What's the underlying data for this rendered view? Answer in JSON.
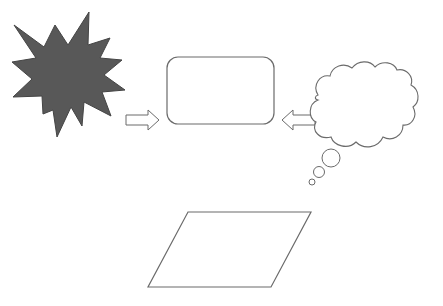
{
  "diagram": {
    "colors": {
      "background": "#ffffff",
      "stroke": "#6b6b6b",
      "star_fill": "#585858",
      "star_stroke": "#444444"
    },
    "shapes": [
      {
        "id": "explosion-star",
        "type": "explosion",
        "fill": "#585858"
      },
      {
        "id": "right-arrow",
        "type": "block-arrow",
        "direction": "right"
      },
      {
        "id": "rounded-rectangle",
        "type": "rounded-rectangle"
      },
      {
        "id": "left-arrow",
        "type": "block-arrow",
        "direction": "left"
      },
      {
        "id": "thought-cloud",
        "type": "thought-bubble"
      },
      {
        "id": "parallelogram",
        "type": "parallelogram"
      }
    ],
    "text": []
  }
}
